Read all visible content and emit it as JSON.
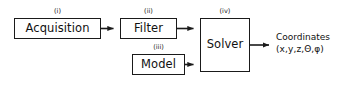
{
  "diagram": {
    "type": "flowchart",
    "title": "",
    "nodes": [
      {
        "id": "acquisition",
        "step": "(i)",
        "label": "Acquisition"
      },
      {
        "id": "filter",
        "step": "(ii)",
        "label": "Filter"
      },
      {
        "id": "model",
        "step": "(iii)",
        "label": "Model"
      },
      {
        "id": "solver",
        "step": "(iv)",
        "label": "Solver"
      }
    ],
    "edges": [
      {
        "from": "acquisition",
        "to": "filter",
        "label": ""
      },
      {
        "from": "filter",
        "to": "solver",
        "label": ""
      },
      {
        "from": "model",
        "to": "solver",
        "label": ""
      },
      {
        "from": "solver",
        "to": "output",
        "label": ""
      }
    ],
    "output": {
      "title": "Coordinates",
      "variables": "(x,y,z,Θ,φ)"
    },
    "colors": {
      "stroke": "#1a1a1a",
      "text": "#111111",
      "background": "#ffffff"
    }
  }
}
